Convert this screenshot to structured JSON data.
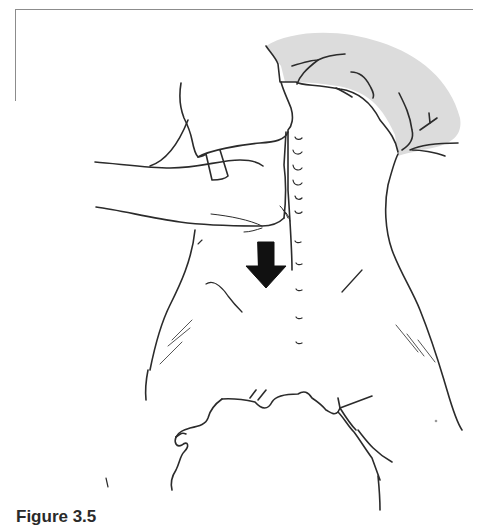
{
  "figure": {
    "caption_label": "Figure 3.5",
    "caption_text": "",
    "illustration": {
      "subject": "hand-pressing-down-on-back",
      "arrow_direction": "down",
      "arrow_color": "#111111",
      "line_color": "#2b2b2b",
      "shade_color": "#dcdcdc",
      "frame_color": "#8c8c8c"
    }
  }
}
